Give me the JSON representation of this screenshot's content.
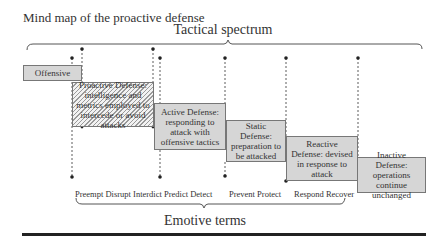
{
  "diagram": {
    "title": "Mind map of the proactive defense",
    "top_brace_label": "Tactical spectrum",
    "bottom_brace_label": "Emotive terms",
    "nodes": [
      {
        "id": "offensive",
        "label": "Offensive",
        "style": "solid-gray"
      },
      {
        "id": "proactive",
        "label": "Proactive Defense: intelligence and metrics employed to intercede or avoid attacks",
        "style": "hatched"
      },
      {
        "id": "active",
        "label": "Active Defense: responding to attack with offensive tactics",
        "style": "solid-gray"
      },
      {
        "id": "static",
        "label": "Static Defense: preparation to be attacked",
        "style": "solid-gray"
      },
      {
        "id": "reactive",
        "label": "Reactive Defense: devised in response to attack",
        "style": "solid-gray"
      },
      {
        "id": "inactive",
        "label": "Inactive Defense: operations continue unchanged",
        "style": "solid-gray"
      }
    ],
    "emotive_term_groups": [
      {
        "label": "Preempt Disrupt Interdict Predict Detect"
      },
      {
        "label": "Prevent Protect"
      },
      {
        "label": "Respond Recover"
      }
    ],
    "colors": {
      "box_fill": "#d6d6d6",
      "box_border": "#777777",
      "line": "#333333",
      "rule": "#222222"
    }
  }
}
